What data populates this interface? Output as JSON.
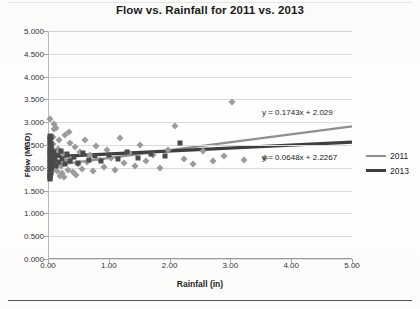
{
  "chart_data": {
    "type": "scatter",
    "title": "Flow vs. Rainfall for 2011 vs. 2013",
    "xlabel": "Rainfall (in)",
    "ylabel": "Flow (MGD)",
    "xlim": [
      0,
      5
    ],
    "ylim": [
      0,
      5
    ],
    "xticks": [
      "0.00",
      "1.00",
      "2.00",
      "3.00",
      "4.00",
      "5.00"
    ],
    "xtick_values": [
      0,
      1,
      2,
      3,
      4,
      5
    ],
    "yticks": [
      "0.000",
      "0.500",
      "1.000",
      "1.500",
      "2.000",
      "2.500",
      "3.000",
      "3.500",
      "4.000",
      "4.500",
      "5.000"
    ],
    "ytick_values": [
      0,
      0.5,
      1,
      1.5,
      2,
      2.5,
      3,
      3.5,
      4,
      4.5,
      5
    ],
    "grid": "horizontal",
    "legend_position": "right",
    "series": [
      {
        "name": "2011",
        "marker": "diamond",
        "color": "#9b9b9b",
        "trendline": {
          "equation": "y = 0.1743x + 2.029",
          "slope": 0.1743,
          "intercept": 2.029,
          "color": "#8f8f8f"
        },
        "points": [
          [
            0.02,
            1.86
          ],
          [
            0.03,
            2.02
          ],
          [
            0.04,
            2.18
          ],
          [
            0.05,
            2.34
          ],
          [
            0.06,
            2.52
          ],
          [
            0.07,
            2.68
          ],
          [
            0.08,
            2.84
          ],
          [
            0.09,
            2.96
          ],
          [
            0.1,
            2.1
          ],
          [
            0.11,
            2.26
          ],
          [
            0.13,
            1.92
          ],
          [
            0.15,
            2.42
          ],
          [
            0.17,
            2.62
          ],
          [
            0.19,
            2.05
          ],
          [
            0.21,
            1.88
          ],
          [
            0.23,
            2.3
          ],
          [
            0.26,
            2.72
          ],
          [
            0.28,
            2.15
          ],
          [
            0.31,
            1.95
          ],
          [
            0.34,
            2.55
          ],
          [
            0.37,
            2.2
          ],
          [
            0.4,
            1.9
          ],
          [
            0.43,
            2.45
          ],
          [
            0.47,
            2.08
          ],
          [
            0.51,
            2.35
          ],
          [
            0.55,
            1.98
          ],
          [
            0.59,
            2.6
          ],
          [
            0.63,
            2.12
          ],
          [
            0.68,
            2.28
          ],
          [
            0.73,
            1.93
          ],
          [
            0.78,
            2.48
          ],
          [
            0.84,
            2.18
          ],
          [
            0.9,
            2.02
          ],
          [
            0.96,
            2.38
          ],
          [
            1.02,
            2.22
          ],
          [
            1.09,
            1.96
          ],
          [
            1.16,
            2.66
          ],
          [
            1.24,
            2.1
          ],
          [
            1.32,
            2.32
          ],
          [
            1.41,
            2.04
          ],
          [
            1.5,
            2.5
          ],
          [
            1.6,
            2.16
          ],
          [
            1.71,
            2.28
          ],
          [
            1.83,
            1.99
          ],
          [
            1.95,
            2.4
          ],
          [
            2.08,
            2.92
          ],
          [
            2.22,
            2.2
          ],
          [
            2.37,
            2.08
          ],
          [
            2.53,
            2.36
          ],
          [
            2.7,
            2.14
          ],
          [
            2.88,
            2.26
          ],
          [
            3.01,
            3.45
          ],
          [
            3.2,
            2.18
          ],
          [
            3.55,
            2.22
          ],
          [
            0.015,
            3.06
          ],
          [
            0.12,
            2.88
          ],
          [
            0.18,
            1.82
          ],
          [
            0.25,
            1.8
          ],
          [
            0.33,
            2.78
          ],
          [
            0.45,
            1.84
          ]
        ]
      },
      {
        "name": "2013",
        "marker": "square",
        "color": "#4a4a4a",
        "trendline": {
          "equation": "y = 0.0648x + 2.2267",
          "slope": 0.0648,
          "intercept": 2.2267,
          "color": "#3f3f3f"
        },
        "points": [
          [
            0.01,
            1.8
          ],
          [
            0.01,
            1.9
          ],
          [
            0.01,
            2.0
          ],
          [
            0.01,
            2.1
          ],
          [
            0.01,
            2.2
          ],
          [
            0.01,
            2.3
          ],
          [
            0.01,
            2.4
          ],
          [
            0.01,
            2.5
          ],
          [
            0.01,
            2.6
          ],
          [
            0.01,
            2.7
          ],
          [
            0.02,
            1.85
          ],
          [
            0.02,
            1.95
          ],
          [
            0.02,
            2.05
          ],
          [
            0.02,
            2.15
          ],
          [
            0.02,
            2.25
          ],
          [
            0.02,
            2.35
          ],
          [
            0.02,
            2.45
          ],
          [
            0.02,
            2.55
          ],
          [
            0.02,
            2.65
          ],
          [
            0.03,
            1.88
          ],
          [
            0.03,
            2.08
          ],
          [
            0.03,
            2.28
          ],
          [
            0.03,
            2.48
          ],
          [
            0.03,
            2.68
          ],
          [
            0.04,
            1.92
          ],
          [
            0.04,
            2.12
          ],
          [
            0.04,
            2.32
          ],
          [
            0.04,
            2.52
          ],
          [
            0.05,
            2.0
          ],
          [
            0.05,
            2.2
          ],
          [
            0.05,
            2.4
          ],
          [
            0.06,
            2.06
          ],
          [
            0.06,
            2.26
          ],
          [
            0.07,
            2.16
          ],
          [
            0.08,
            2.24
          ],
          [
            0.09,
            2.34
          ],
          [
            0.1,
            2.18
          ],
          [
            0.12,
            2.04
          ],
          [
            0.14,
            2.28
          ],
          [
            0.16,
            2.12
          ],
          [
            0.19,
            2.36
          ],
          [
            0.22,
            2.2
          ],
          [
            0.26,
            2.08
          ],
          [
            0.3,
            2.3
          ],
          [
            0.35,
            2.16
          ],
          [
            0.41,
            2.24
          ],
          [
            0.48,
            2.1
          ],
          [
            0.56,
            2.32
          ],
          [
            0.65,
            2.18
          ],
          [
            0.75,
            2.26
          ],
          [
            0.86,
            2.14
          ],
          [
            0.99,
            2.28
          ],
          [
            1.13,
            2.2
          ],
          [
            1.29,
            2.34
          ],
          [
            1.47,
            2.22
          ],
          [
            1.67,
            2.3
          ],
          [
            1.9,
            2.26
          ],
          [
            2.16,
            2.55
          ],
          [
            0.01,
            1.75
          ],
          [
            0.02,
            1.78
          ]
        ]
      }
    ]
  },
  "legend": {
    "items": [
      {
        "label": "2011"
      },
      {
        "label": "2013"
      }
    ]
  }
}
